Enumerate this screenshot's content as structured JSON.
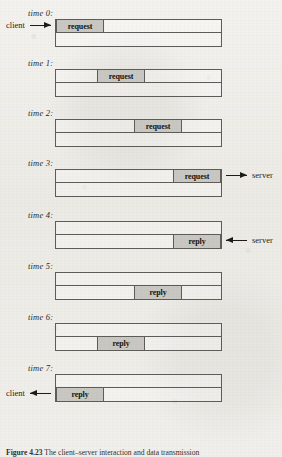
{
  "figure": {
    "caption_label": "Figure 4.23",
    "caption_text": "The client–server interaction and data transmission",
    "client_label": "client",
    "server_label": "server",
    "request_label": "request",
    "reply_label": "reply",
    "colors": {
      "paper": "#efeeea",
      "ink": "#1d1c1a",
      "rule": "#5d5c58",
      "block_fill": "#c9c7c2"
    }
  },
  "steps": [
    {
      "time_label": "time 0:",
      "row": "top",
      "message": "request",
      "block_left": 0,
      "block_width": 48,
      "divider_at": null,
      "endpoint": {
        "side": "left",
        "text": "client",
        "direction": "right"
      }
    },
    {
      "time_label": "time 1:",
      "row": "top",
      "message": "request",
      "block_left": 41,
      "block_width": 48,
      "divider_at": null,
      "endpoint": null
    },
    {
      "time_label": "time 2:",
      "row": "top",
      "message": "request",
      "block_left": 78,
      "block_width": 48,
      "divider_at": null,
      "endpoint": null
    },
    {
      "time_label": "time 3:",
      "row": "top",
      "message": "request",
      "block_left": 117,
      "block_width": 48,
      "divider_at": null,
      "endpoint": {
        "side": "right",
        "text": "server",
        "direction": "right"
      }
    },
    {
      "time_label": "time 4:",
      "row": "bottom",
      "message": "reply",
      "block_left": 117,
      "block_width": 48,
      "divider_at": null,
      "endpoint": {
        "side": "right",
        "text": "server",
        "direction": "left"
      }
    },
    {
      "time_label": "time 5:",
      "row": "bottom",
      "message": "reply",
      "block_left": 78,
      "block_width": 48,
      "divider_at": null,
      "endpoint": null
    },
    {
      "time_label": "time 6:",
      "row": "bottom",
      "message": "reply",
      "block_left": 41,
      "block_width": 48,
      "divider_at": null,
      "endpoint": null
    },
    {
      "time_label": "time 7:",
      "row": "bottom",
      "message": "reply",
      "block_left": 0,
      "block_width": 48,
      "divider_at": null,
      "endpoint": {
        "side": "left",
        "text": "client",
        "direction": "left"
      }
    }
  ],
  "layout": {
    "step_tops": [
      8,
      58,
      108,
      158,
      210,
      261,
      312,
      363
    ],
    "box_offset_y": 11,
    "label_x": 28
  }
}
